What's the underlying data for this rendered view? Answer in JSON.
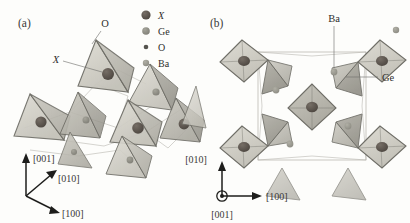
{
  "figure": {
    "background_color": "#fdfdfb",
    "panels": [
      {
        "id": "a",
        "label": "(a)",
        "description": "Perspective view of corner-linked Ge-O tetrahedra network with X atoms",
        "callouts": [
          {
            "name": "oxygen-callout",
            "text": "O",
            "italic": false
          },
          {
            "name": "x-atom-callout",
            "text": "X",
            "italic": true
          }
        ],
        "axes": {
          "name": "axis-triad-a",
          "directions": [
            {
              "label": "[001]",
              "orientation": "up"
            },
            {
              "label": "[010]",
              "orientation": "upper-right"
            },
            {
              "label": "[100]",
              "orientation": "lower-right"
            }
          ]
        }
      },
      {
        "id": "b",
        "label": "(b)",
        "description": "Projection along [001] showing unit cell with Ba atoms in cavities",
        "callouts": [
          {
            "name": "barium-callout",
            "text": "Ba",
            "italic": false
          },
          {
            "name": "germanium-callout",
            "text": "Ge",
            "italic": false
          }
        ],
        "axes": {
          "name": "axis-triad-b",
          "directions": [
            {
              "label": "[010]",
              "orientation": "up"
            },
            {
              "label": "[100]",
              "orientation": "right"
            },
            {
              "label": "[001]",
              "orientation": "out-of-plane"
            }
          ]
        }
      }
    ],
    "legend": {
      "name": "atom-legend",
      "entries": [
        {
          "symbol": "X",
          "italic": true,
          "color": "#58514b",
          "radius": 4.6
        },
        {
          "symbol": "Ge",
          "italic": false,
          "color": "#8e8d84",
          "radius": 3.8
        },
        {
          "symbol": "O",
          "italic": false,
          "color": "#55534e",
          "radius": 2.3
        },
        {
          "symbol": "Ba",
          "italic": false,
          "color": "#9a998f",
          "radius": 3.2
        }
      ]
    },
    "colors": {
      "tetrahedron_face_light": "#d2d1c9",
      "tetrahedron_face_dark": "#a8a79e",
      "tetrahedron_edge": "#6f6e67",
      "cell_box": "#b2b0aa",
      "leader_line": "#6c6c68",
      "axis": "#1d1d1b",
      "text": "#2e2e2c"
    }
  }
}
